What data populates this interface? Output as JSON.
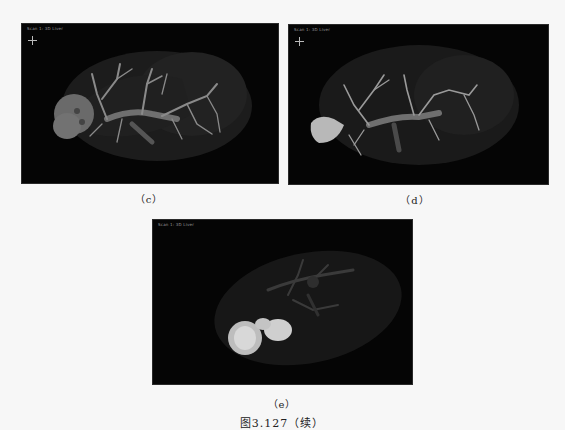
{
  "figure": {
    "title": "图3.127（续）",
    "panels": [
      {
        "id": "c",
        "caption": "（c）",
        "overlay_label": "Scan 1: 3D Liver",
        "icon": "orientation-axes-icon"
      },
      {
        "id": "d",
        "caption": "（d）",
        "overlay_label": "Scan 1: 3D Liver",
        "icon": "orientation-axes-icon"
      },
      {
        "id": "e",
        "caption": "（e）",
        "overlay_label": "Scan 1: 3D Liver"
      }
    ]
  },
  "colors": {
    "page_background": "#f7f7f7",
    "panel_background": "#050505",
    "liver_surface": "#2a2a2a",
    "vessel": "#8a8a8a",
    "lesion": "#cfcfcf"
  }
}
